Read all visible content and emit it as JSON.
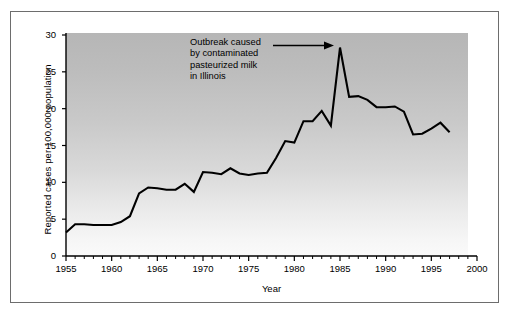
{
  "figure": {
    "background_color": "#ffffff",
    "frame_color": "#6d6d6d",
    "plot_fill_top": "#b6b6b6",
    "plot_fill_bottom": "#fafafa",
    "line_color": "#000000"
  },
  "annotation": {
    "line1": "Outbreak caused",
    "line2": "by contaminated",
    "line3": "pasteurized milk",
    "line4": "in Illinois",
    "arrow": "arrow-right",
    "points_to_year": 1984
  },
  "axes": {
    "x_title": "Year",
    "y_title": "Reported cases per 100,000 population",
    "x_ticks": [
      "1955",
      "1960",
      "1965",
      "1970",
      "1975",
      "1980",
      "1985",
      "1990",
      "1995",
      "2000"
    ],
    "y_ticks": [
      "0",
      "5",
      "10",
      "15",
      "20",
      "25",
      "30"
    ]
  },
  "chart_data": {
    "type": "line",
    "title": "",
    "xlabel": "Year",
    "ylabel": "Reported cases per 100,000 population",
    "xlim": [
      1955,
      2000
    ],
    "ylim": [
      0,
      30
    ],
    "xticks": [
      1955,
      1960,
      1965,
      1970,
      1975,
      1980,
      1985,
      1990,
      1995,
      2000
    ],
    "yticks": [
      0,
      5,
      10,
      15,
      20,
      25,
      30
    ],
    "minor_xtick_interval": 1,
    "grid": false,
    "legend": false,
    "annotations": [
      {
        "text": "Outbreak caused by contaminated pasteurized milk in Illinois",
        "x": 1984,
        "y": 28.3,
        "arrow": true
      }
    ],
    "series": [
      {
        "name": "Reported cases per 100,000 population",
        "color": "#000000",
        "x": [
          1955,
          1956,
          1957,
          1958,
          1959,
          1960,
          1961,
          1962,
          1963,
          1964,
          1965,
          1966,
          1967,
          1968,
          1969,
          1970,
          1971,
          1972,
          1973,
          1974,
          1975,
          1976,
          1977,
          1978,
          1979,
          1980,
          1981,
          1982,
          1983,
          1984,
          1985,
          1986,
          1987,
          1988,
          1989,
          1990,
          1991,
          1992,
          1993,
          1994,
          1995,
          1996,
          1997
        ],
        "values": [
          3.2,
          4.3,
          4.3,
          4.2,
          4.2,
          4.2,
          4.6,
          5.4,
          8.5,
          9.3,
          9.2,
          9.0,
          9.0,
          9.8,
          8.7,
          11.4,
          11.3,
          11.1,
          11.9,
          11.2,
          11.0,
          11.2,
          11.3,
          13.3,
          15.6,
          15.4,
          18.3,
          18.3,
          19.7,
          17.7,
          28.3,
          21.6,
          21.7,
          21.2,
          20.2,
          20.2,
          20.3,
          19.6,
          16.5,
          16.6,
          17.3,
          18.1,
          16.8
        ]
      }
    ]
  }
}
